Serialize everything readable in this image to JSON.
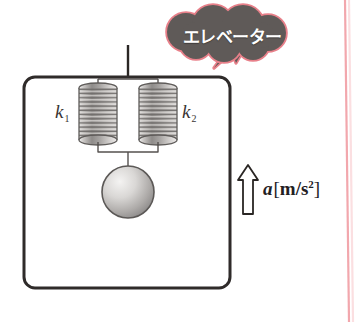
{
  "figure": {
    "title_note": "elevator with two parallel springs and hanging mass",
    "background_color": "#ffffff"
  },
  "callout": {
    "text": "エレベーター",
    "fill_color": "#5f5a58",
    "outline_color": "#e8808a",
    "text_color": "#ffffff"
  },
  "elevator": {
    "outline_color": "#2f2b2a",
    "cable_color": "#2a2624",
    "corner_radius": 10
  },
  "springs": [
    {
      "label": "k",
      "subscript": "1",
      "coils": 16,
      "side": "left"
    },
    {
      "label": "k",
      "subscript": "2",
      "coils": 16,
      "side": "right"
    }
  ],
  "mass": {
    "shape": "sphere",
    "fill_light": "#e6e4e2",
    "fill_dark": "#8d8a88",
    "outline_color": "#5c5957"
  },
  "acceleration": {
    "symbol": "a",
    "bracket_open": "[",
    "unit": "m/s",
    "unit_exponent": "2",
    "bracket_close": "]",
    "direction": "up",
    "arrow_color": "#2a2624"
  },
  "page_rule": {
    "color": "#f2a7ad"
  }
}
